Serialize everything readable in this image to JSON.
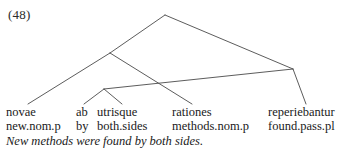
{
  "example": {
    "number_label": "(48)"
  },
  "interlinear": {
    "source_row": [
      {
        "text": "novae",
        "x": 6
      },
      {
        "text": "ab",
        "x": 76
      },
      {
        "text": "utrisque",
        "x": 97
      },
      {
        "text": "rationes",
        "x": 172
      },
      {
        "text": "reperiebantur",
        "x": 268
      }
    ],
    "gloss_row": [
      {
        "text": "new.nom.p",
        "x": 6
      },
      {
        "text": "by",
        "x": 76
      },
      {
        "text": "both.sides",
        "x": 97
      },
      {
        "text": "methods.nom.p",
        "x": 172
      },
      {
        "text": "found.pass.pl",
        "x": 268
      }
    ],
    "translation": "New methods were found by both sides."
  },
  "tree": {
    "line_color": "#4a4a4a",
    "line_width": 0.9,
    "nodes": {
      "root": {
        "x": 165,
        "y": 15
      },
      "left_node": {
        "x": 110,
        "y": 53
      },
      "right_node": {
        "x": 293,
        "y": 69
      },
      "mid_node": {
        "x": 104,
        "y": 89
      }
    },
    "edges": [
      {
        "name": "root-to-left-node",
        "x1": 165,
        "y1": 15,
        "x2": 110,
        "y2": 53
      },
      {
        "name": "root-to-right-node",
        "x1": 165,
        "y1": 15,
        "x2": 293,
        "y2": 69
      },
      {
        "name": "left-node-to-novae",
        "x1": 110,
        "y1": 53,
        "x2": 28,
        "y2": 104
      },
      {
        "name": "left-node-to-rationes",
        "x1": 110,
        "y1": 53,
        "x2": 192,
        "y2": 104
      },
      {
        "name": "mid-node-to-ab",
        "x1": 104,
        "y1": 89,
        "x2": 84,
        "y2": 104
      },
      {
        "name": "mid-node-to-utrisque",
        "x1": 104,
        "y1": 89,
        "x2": 122,
        "y2": 104
      },
      {
        "name": "mid-node-to-right-node",
        "x1": 104,
        "y1": 89,
        "x2": 293,
        "y2": 69
      },
      {
        "name": "right-node-to-verb",
        "x1": 293,
        "y1": 69,
        "x2": 306,
        "y2": 104
      }
    ]
  }
}
